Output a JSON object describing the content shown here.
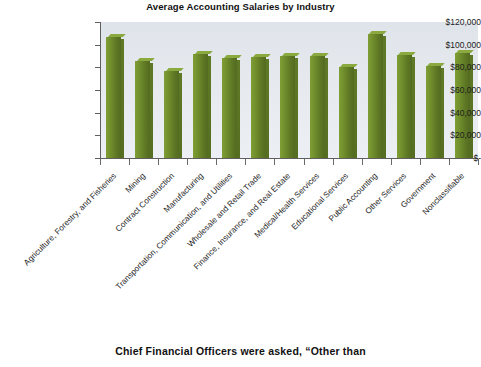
{
  "chart_data": {
    "type": "bar",
    "title": "Average Accounting Salaries by Industry",
    "xlabel": "",
    "ylabel": "",
    "ylim": [
      0,
      120000
    ],
    "grid": false,
    "legend": "none",
    "y_ticks": [
      {
        "value": 120000,
        "label": "$120,000"
      },
      {
        "value": 100000,
        "label": "$100,000"
      },
      {
        "value": 80000,
        "label": "$80,000"
      },
      {
        "value": 60000,
        "label": "$60,000"
      },
      {
        "value": 40000,
        "label": "$40,000"
      },
      {
        "value": 20000,
        "label": "$20,000"
      },
      {
        "value": 0,
        "label": "$-"
      }
    ],
    "categories": [
      "Agriculture, Forestry, and Fisheries",
      "Mining",
      "Contract Construction",
      "Manufacturing",
      "Transportation, Communication, and Utilities",
      "Wholesale and Retail Trade",
      "Finance, Insurance, and Real Estate",
      "Medical/Health Services",
      "Educational Services",
      "Public Accounting",
      "Other Services",
      "Government",
      "Nonclassifiable"
    ],
    "values": [
      107000,
      86000,
      77000,
      92000,
      88000,
      89000,
      90000,
      90000,
      80000,
      109000,
      91000,
      81000,
      93000
    ],
    "bar_color": "#6f8c2c",
    "plot_background": "#e4e8ee"
  },
  "caption": {
    "text": "Chief Financial Officers were asked, “Other than"
  }
}
